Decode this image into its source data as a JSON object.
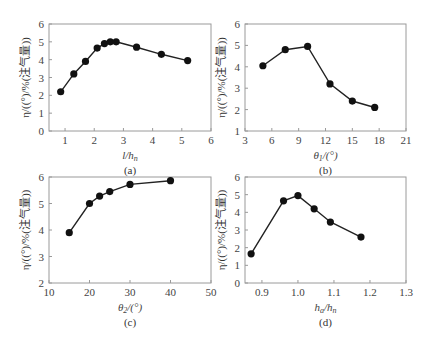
{
  "figure": {
    "panels": [
      "a",
      "b",
      "c",
      "d"
    ]
  },
  "chart_data": [
    {
      "id": "a",
      "caption": "(a)",
      "type": "line",
      "xlabel": "l/h_n",
      "ylabel": "η/((°)/%(注气量))",
      "xlim": [
        0.45,
        6
      ],
      "ylim": [
        0,
        6
      ],
      "xticks": [
        1,
        2,
        3,
        4,
        5,
        6
      ],
      "yticks": [
        0,
        1,
        2,
        3,
        4,
        5,
        6
      ],
      "grid": false,
      "x": [
        0.85,
        1.3,
        1.7,
        2.1,
        2.35,
        2.55,
        2.75,
        3.45,
        4.3,
        5.2
      ],
      "y": [
        2.2,
        3.2,
        3.9,
        4.65,
        4.9,
        5.0,
        5.0,
        4.7,
        4.3,
        3.95
      ],
      "box": {
        "left": 49,
        "right": 211,
        "top": 24,
        "bottom": 131
      }
    },
    {
      "id": "b",
      "caption": "(b)",
      "type": "line",
      "xlabel": "θ_1/(°)",
      "ylabel": "η/((°)/%(注气量))",
      "xlim": [
        3,
        21
      ],
      "ylim": [
        1,
        6
      ],
      "xticks": [
        3,
        6,
        9,
        12,
        15,
        18,
        21
      ],
      "yticks": [
        1,
        2,
        3,
        4,
        5,
        6
      ],
      "grid": false,
      "x": [
        5,
        7.5,
        10,
        12.5,
        15,
        17.5
      ],
      "y": [
        4.05,
        4.8,
        4.95,
        3.2,
        2.4,
        2.1
      ],
      "box": {
        "left": 245,
        "right": 406,
        "top": 24,
        "bottom": 131
      }
    },
    {
      "id": "c",
      "caption": "(c)",
      "type": "line",
      "xlabel": "θ_2/(°)",
      "ylabel": "η/((°)/%(注气量))",
      "xlim": [
        10,
        50
      ],
      "ylim": [
        2,
        6
      ],
      "xticks": [
        10,
        20,
        30,
        40,
        50
      ],
      "yticks": [
        2,
        3,
        4,
        5,
        6
      ],
      "grid": false,
      "x": [
        15,
        20,
        22.5,
        25,
        30,
        40
      ],
      "y": [
        3.9,
        5.0,
        5.28,
        5.45,
        5.72,
        5.86
      ],
      "box": {
        "left": 49,
        "right": 211,
        "top": 177,
        "bottom": 283
      }
    },
    {
      "id": "d",
      "caption": "(d)",
      "type": "line",
      "xlabel": "h_a/h_n",
      "ylabel": "η/((°)/%(注气量))",
      "xlim": [
        0.853,
        1.3
      ],
      "ylim": [
        0,
        6
      ],
      "xticks": [
        0.9,
        1.0,
        1.1,
        1.2,
        1.3
      ],
      "xticklabels": [
        "0.9",
        "1.0",
        "1.1",
        "1.2",
        "1.3"
      ],
      "yticks": [
        0,
        1,
        2,
        3,
        4,
        5,
        6
      ],
      "grid": false,
      "x": [
        0.87,
        0.96,
        1.0,
        1.045,
        1.09,
        1.175
      ],
      "y": [
        1.65,
        4.65,
        4.95,
        4.2,
        3.45,
        2.6
      ],
      "box": {
        "left": 245,
        "right": 406,
        "top": 177,
        "bottom": 283
      }
    }
  ]
}
